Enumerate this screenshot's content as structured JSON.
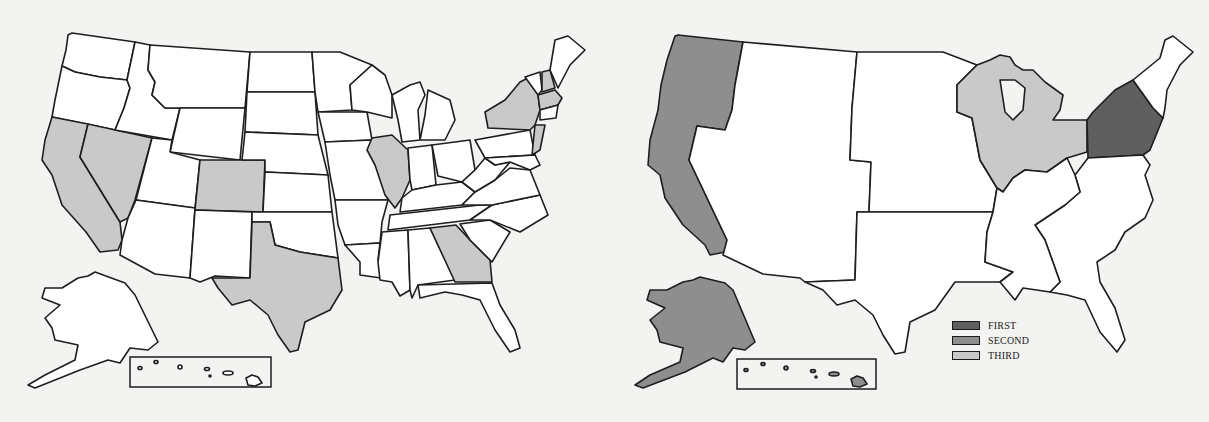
{
  "colors": {
    "background": "#f3f3f1",
    "border": "#1e1e1e",
    "unshaded": "#ffffff",
    "first": "#5f5f5f",
    "second": "#8e8e8e",
    "third": "#c9c9c9"
  },
  "left_map": {
    "description": "US state map with selected states shaded light gray",
    "shaded_states_third": [
      "California",
      "Nevada",
      "Colorado",
      "Texas",
      "Illinois",
      "Georgia",
      "New York",
      "New Hampshire",
      "Massachusetts",
      "New Jersey"
    ],
    "insets": [
      "Alaska",
      "Hawaii"
    ]
  },
  "right_map": {
    "description": "US regional map with regions shaded by rank",
    "regions": [
      {
        "name": "Pacific (WA, OR, CA)",
        "rank": "SECOND"
      },
      {
        "name": "Alaska",
        "rank": "SECOND"
      },
      {
        "name": "Hawaii",
        "rank": "SECOND"
      },
      {
        "name": "East North Central (WI, MI, IL, IN, OH)",
        "rank": "THIRD"
      },
      {
        "name": "Middle Atlantic (NY, PA, NJ)",
        "rank": "FIRST"
      }
    ]
  },
  "legend": {
    "items": [
      {
        "label": "FIRST",
        "color": "#5f5f5f"
      },
      {
        "label": "SECOND",
        "color": "#8e8e8e"
      },
      {
        "label": "THIRD",
        "color": "#c9c9c9"
      }
    ]
  }
}
